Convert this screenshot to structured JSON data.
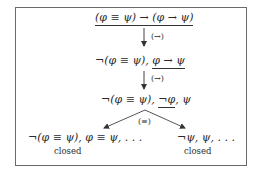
{
  "diagram": {
    "nodes": [
      {
        "id": "root",
        "formula": "(φ ≡ ψ) → (φ → ψ)",
        "parts": [
          "(φ ≡ ψ) → (φ → ψ)"
        ],
        "underlined": "whole"
      },
      {
        "id": "n1",
        "parts": [
          "¬(φ ≡ ψ), ",
          "φ → ψ"
        ],
        "underlined": "φ → ψ"
      },
      {
        "id": "n2",
        "parts": [
          "¬(φ ≡ ψ), ",
          "¬φ",
          ", ψ"
        ],
        "underlined": "¬φ"
      },
      {
        "id": "leftLeaf",
        "formula": "¬(φ ≡ ψ), φ ≡ ψ, . . .",
        "status": "closed"
      },
      {
        "id": "rightLeaf",
        "formula": "¬ψ, ψ, . . .",
        "status": "closed"
      }
    ],
    "edges": [
      {
        "from": "root",
        "to": "n1",
        "rule": "(→)"
      },
      {
        "from": "n1",
        "to": "n2",
        "rule": "(→)"
      },
      {
        "from": "n2",
        "to": "leftLeaf",
        "rule": "(≡)"
      },
      {
        "from": "n2",
        "to": "rightLeaf",
        "rule": "(≡)"
      }
    ],
    "branch_rule": "(≡)",
    "closed_label": "closed"
  },
  "colors": {
    "border": "#6a6a6a",
    "text": "#2a2a2a",
    "edge": "#555555"
  }
}
